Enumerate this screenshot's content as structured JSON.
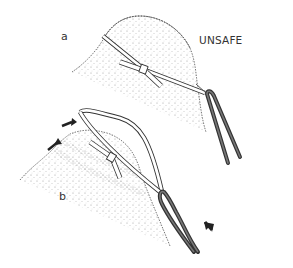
{
  "figure": {
    "panels": [
      {
        "id": "a",
        "label": "a",
        "caption": "UNSAFE"
      },
      {
        "id": "b",
        "label": "b"
      }
    ],
    "colors": {
      "line": "#333333",
      "rope": "#4a4a4a",
      "stipple": "#8a8a8a",
      "background": "#ffffff"
    }
  }
}
